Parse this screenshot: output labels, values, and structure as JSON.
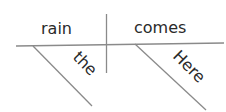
{
  "diagram": {
    "type": "sentence-diagram",
    "sentence": "Here comes the rain",
    "subject": "rain",
    "predicate": "comes",
    "modifiers": [
      {
        "word": "the",
        "modifies": "rain"
      },
      {
        "word": "Here",
        "modifies": "comes"
      }
    ],
    "colors": {
      "text": "#2a2a2a",
      "lines": "#8a8a8a"
    }
  }
}
